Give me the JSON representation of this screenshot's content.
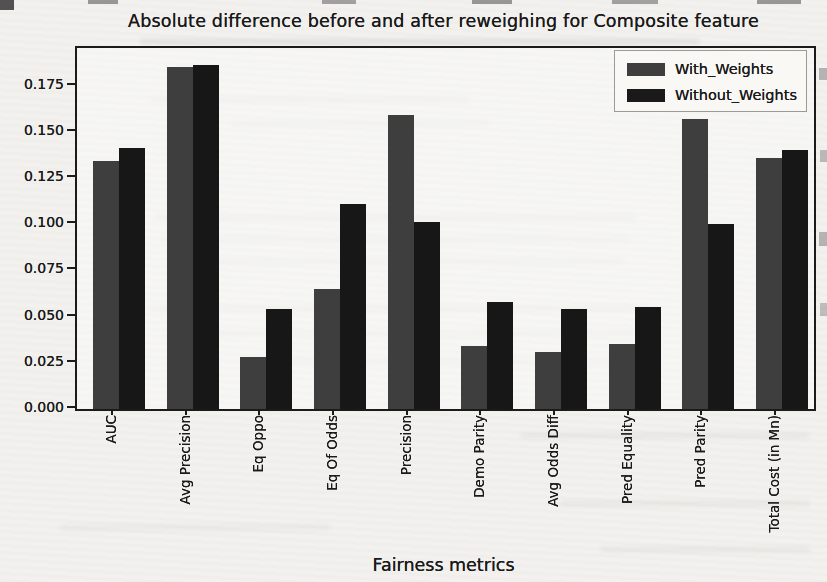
{
  "figure_kind": "scanned matplotlib bar chart",
  "colors": {
    "with_weights_bar": "#3e3e3e",
    "without_weights_bar": "#171717",
    "axis": "#1b1b1b",
    "paper": "#f2f1ee"
  },
  "chart_data": {
    "type": "bar",
    "title": "Absolute difference before and after reweighing for Composite feature",
    "xlabel": "Fairness metrics",
    "ylabel": "",
    "categories": [
      "AUC",
      "Avg Precision",
      "Eq Oppo",
      "Eq Of Odds",
      "Precision",
      "Demo Parity",
      "Avg Odds Diff",
      "Pred Equality",
      "Pred Parity",
      "Total Cost (in Mn)"
    ],
    "series": [
      {
        "name": "With_Weights",
        "color": "#3e3e3e",
        "values": [
          0.134,
          0.185,
          0.028,
          0.065,
          0.159,
          0.034,
          0.031,
          0.035,
          0.157,
          0.136
        ]
      },
      {
        "name": "Without_Weights",
        "color": "#171717",
        "values": [
          0.141,
          0.186,
          0.054,
          0.111,
          0.101,
          0.058,
          0.054,
          0.055,
          0.1,
          0.14
        ]
      }
    ],
    "ylim": [
      0,
      0.1953
    ],
    "ytick_values": [
      0.0,
      0.025,
      0.05,
      0.075,
      0.1,
      0.125,
      0.15,
      0.175
    ],
    "ytick_labels": [
      "0.000",
      "0.025",
      "0.050",
      "0.075",
      "0.100",
      "0.125",
      "0.150",
      "0.175"
    ],
    "grid": false,
    "legend_position": "upper right"
  }
}
